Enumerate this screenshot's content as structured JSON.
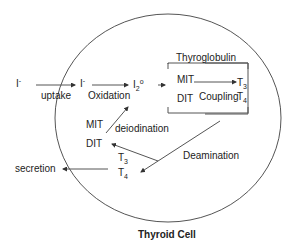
{
  "diagram": {
    "title": "Thyroid Cell",
    "labels": {
      "iodide_outside": "I",
      "iodide_outside_charge": "-",
      "uptake": "uptake",
      "iodide_inside": "I",
      "iodide_inside_charge": "-",
      "oxidation": "Oxidation",
      "iodine": "I",
      "iodine_sub": "2",
      "iodine_sup": "o",
      "thyroglobulin": "Thyroglobulin",
      "mit_tg": "MIT",
      "dit_tg": "DIT",
      "coupling": "Coupling",
      "t3_tg": "T",
      "t3_tg_sub": "3",
      "t4_tg": "T",
      "t4_tg_sub": "4",
      "mit": "MIT",
      "dit": "DIT",
      "deiodination": "deiodination",
      "deamination": "Deamination",
      "t3": "T",
      "t3_sub": "3",
      "t4": "T",
      "t4_sub": "4",
      "secretion": "secretion"
    },
    "colors": {
      "line": "#555555",
      "text": "#222222"
    }
  }
}
